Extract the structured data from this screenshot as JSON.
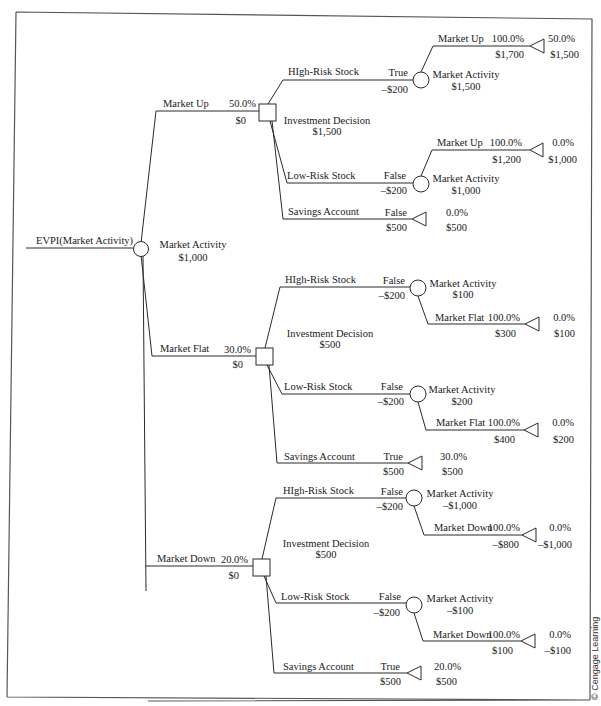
{
  "root": {
    "label": "EVPI(Market Activity)",
    "chance_label": "Market Activity",
    "chance_value": "$1,000"
  },
  "scenarios": [
    {
      "name": "Market Up",
      "prob": "50.0%",
      "value": "$0",
      "decision_label": "Investment Decision",
      "decision_value": "$1,500",
      "options": [
        {
          "name": "HIgh-Risk Stock",
          "flag": "True",
          "cost": "–$200",
          "chance": {
            "label": "Market Activity",
            "value": "$1,500",
            "branch": {
              "name": "Market Up",
              "prob": "100.0%",
              "payoff": "$1,700",
              "end_prob": "50.0%",
              "end_value": "$1,500"
            }
          }
        },
        {
          "name": "Low-Risk Stock",
          "flag": "False",
          "cost": "–$200",
          "chance": {
            "label": "Market Activity",
            "value": "$1,000",
            "branch": {
              "name": "Market Up",
              "prob": "100.0%",
              "payoff": "$1,200",
              "end_prob": "0.0%",
              "end_value": "$1,000"
            }
          }
        },
        {
          "name": "Savings Account",
          "flag": "False",
          "cost": "$500",
          "end_prob": "0.0%",
          "end_value": "$500"
        }
      ]
    },
    {
      "name": "Market Flat",
      "prob": "30.0%",
      "value": "$0",
      "decision_label": "Investment Decision",
      "decision_value": "$500",
      "options": [
        {
          "name": "HIgh-Risk Stock",
          "flag": "False",
          "cost": "–$200",
          "chance": {
            "label": "Market Activity",
            "value": "$100",
            "branch": {
              "name": "Market Flat",
              "prob": "100.0%",
              "payoff": "$300",
              "end_prob": "0.0%",
              "end_value": "$100"
            }
          }
        },
        {
          "name": "Low-Risk Stock",
          "flag": "False",
          "cost": "–$200",
          "chance": {
            "label": "Market Activity",
            "value": "$200",
            "branch": {
              "name": "Market Flat",
              "prob": "100.0%",
              "payoff": "$400",
              "end_prob": "0.0%",
              "end_value": "$200"
            }
          }
        },
        {
          "name": "Savings Account",
          "flag": "True",
          "cost": "$500",
          "end_prob": "30.0%",
          "end_value": "$500"
        }
      ]
    },
    {
      "name": "Market Down",
      "prob": "20.0%",
      "value": "$0",
      "decision_label": "Investment Decision",
      "decision_value": "$500",
      "options": [
        {
          "name": "HIgh-Risk Stock",
          "flag": "False",
          "cost": "–$200",
          "chance": {
            "label": "Market Activity",
            "value": "–$1,000",
            "branch": {
              "name": "Market Down",
              "prob": "100.0%",
              "payoff": "–$800",
              "end_prob": "0.0%",
              "end_value": "–$1,000"
            }
          }
        },
        {
          "name": "Low-Risk Stock",
          "flag": "False",
          "cost": "–$200",
          "chance": {
            "label": "Market Activity",
            "value": "–$100",
            "branch": {
              "name": "Market Down",
              "prob": "100.0%",
              "payoff": "$100",
              "end_prob": "0.0%",
              "end_value": "–$100"
            }
          }
        },
        {
          "name": "Savings Account",
          "flag": "True",
          "cost": "$500",
          "end_prob": "20.0%",
          "end_value": "$500"
        }
      ]
    }
  ],
  "credit": "© Cengage Learning"
}
